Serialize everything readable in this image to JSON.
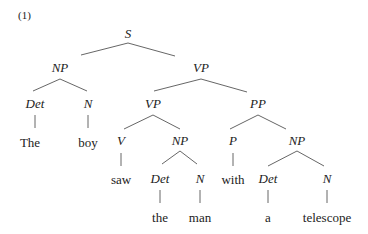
{
  "example_number": "(1)",
  "tree": {
    "nodes": [
      {
        "id": "S",
        "label": "S",
        "type": "category",
        "x": 128,
        "y": 33
      },
      {
        "id": "NP1",
        "label": "NP",
        "type": "category",
        "x": 60,
        "y": 67
      },
      {
        "id": "VP1",
        "label": "VP",
        "type": "category",
        "x": 201,
        "y": 67
      },
      {
        "id": "Det1",
        "label": "Det",
        "type": "category",
        "x": 35,
        "y": 103
      },
      {
        "id": "N1",
        "label": "N",
        "type": "category",
        "x": 88,
        "y": 103
      },
      {
        "id": "VP2",
        "label": "VP",
        "type": "category",
        "x": 153,
        "y": 103
      },
      {
        "id": "PP",
        "label": "PP",
        "type": "category",
        "x": 258,
        "y": 103
      },
      {
        "id": "w_the",
        "label": "The",
        "type": "word",
        "x": 30,
        "y": 142
      },
      {
        "id": "w_boy",
        "label": "boy",
        "type": "word",
        "x": 88,
        "y": 142
      },
      {
        "id": "V",
        "label": "V",
        "type": "category",
        "x": 121,
        "y": 140
      },
      {
        "id": "NP2",
        "label": "NP",
        "type": "category",
        "x": 180,
        "y": 140
      },
      {
        "id": "P",
        "label": "P",
        "type": "category",
        "x": 233,
        "y": 140
      },
      {
        "id": "NP3",
        "label": "NP",
        "type": "category",
        "x": 297,
        "y": 140
      },
      {
        "id": "w_saw",
        "label": "saw",
        "type": "word",
        "x": 121,
        "y": 179
      },
      {
        "id": "Det2",
        "label": "Det",
        "type": "category",
        "x": 160,
        "y": 178
      },
      {
        "id": "N2",
        "label": "N",
        "type": "category",
        "x": 200,
        "y": 178
      },
      {
        "id": "w_with",
        "label": "with",
        "type": "word",
        "x": 233,
        "y": 179
      },
      {
        "id": "Det3",
        "label": "Det",
        "type": "category",
        "x": 268,
        "y": 178
      },
      {
        "id": "N3",
        "label": "N",
        "type": "category",
        "x": 327,
        "y": 178
      },
      {
        "id": "w_the2",
        "label": "the",
        "type": "word",
        "x": 160,
        "y": 217
      },
      {
        "id": "w_man",
        "label": "man",
        "type": "word",
        "x": 200,
        "y": 217
      },
      {
        "id": "w_a",
        "label": "a",
        "type": "word",
        "x": 268,
        "y": 217
      },
      {
        "id": "w_telescope",
        "label": "telescope",
        "type": "word",
        "x": 327,
        "y": 217
      }
    ],
    "edges": [
      {
        "x1": 128,
        "y1": 43,
        "x2": 81,
        "y2": 55
      },
      {
        "x1": 128,
        "y1": 43,
        "x2": 175,
        "y2": 56
      },
      {
        "x1": 60,
        "y1": 79,
        "x2": 33,
        "y2": 91
      },
      {
        "x1": 60,
        "y1": 79,
        "x2": 87,
        "y2": 91
      },
      {
        "x1": 201,
        "y1": 79,
        "x2": 154,
        "y2": 91
      },
      {
        "x1": 201,
        "y1": 79,
        "x2": 247,
        "y2": 92
      },
      {
        "x1": 35,
        "y1": 115,
        "x2": 35,
        "y2": 128
      },
      {
        "x1": 88,
        "y1": 115,
        "x2": 88,
        "y2": 128
      },
      {
        "x1": 153,
        "y1": 115,
        "x2": 124,
        "y2": 129
      },
      {
        "x1": 153,
        "y1": 115,
        "x2": 180,
        "y2": 129
      },
      {
        "x1": 258,
        "y1": 115,
        "x2": 230,
        "y2": 129
      },
      {
        "x1": 258,
        "y1": 115,
        "x2": 286,
        "y2": 129
      },
      {
        "x1": 121,
        "y1": 153,
        "x2": 121,
        "y2": 166
      },
      {
        "x1": 180,
        "y1": 151,
        "x2": 162,
        "y2": 164
      },
      {
        "x1": 180,
        "y1": 151,
        "x2": 197,
        "y2": 164
      },
      {
        "x1": 233,
        "y1": 153,
        "x2": 233,
        "y2": 166
      },
      {
        "x1": 297,
        "y1": 151,
        "x2": 268,
        "y2": 166
      },
      {
        "x1": 297,
        "y1": 151,
        "x2": 324,
        "y2": 166
      },
      {
        "x1": 160,
        "y1": 190,
        "x2": 160,
        "y2": 203
      },
      {
        "x1": 200,
        "y1": 190,
        "x2": 200,
        "y2": 203
      },
      {
        "x1": 268,
        "y1": 190,
        "x2": 268,
        "y2": 203
      },
      {
        "x1": 327,
        "y1": 190,
        "x2": 327,
        "y2": 203
      }
    ]
  }
}
